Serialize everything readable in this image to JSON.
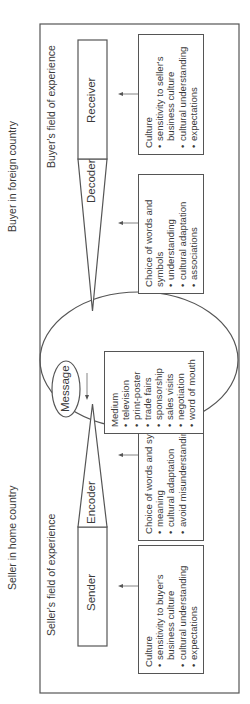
{
  "regions": {
    "seller_label": "Seller in home country",
    "buyer_label": "Buyer in foreign country"
  },
  "fields": {
    "seller": "Seller's field of experience",
    "buyer": "Buyer's field of experience"
  },
  "channel": {
    "sender": "Sender",
    "encoder": "Encoder",
    "decoder": "Decoder",
    "receiver": "Receiver",
    "message": "Message"
  },
  "boxes": {
    "seller_culture": {
      "title": "Culture",
      "items": [
        "sensitivity to buyer's business culture",
        "cultural understanding",
        "expectations"
      ]
    },
    "seller_words": {
      "title": "Choice of words and symbols",
      "items": [
        "meaning",
        "cultural adaptation",
        "avoid misunderstanding"
      ]
    },
    "medium": {
      "title": "Medium",
      "items": [
        "television",
        "print-poster",
        "trade fairs",
        "sponsorship",
        "sales visits",
        "negotiation",
        "word of mouth"
      ]
    },
    "buyer_words": {
      "title": "Choice of words and symbols",
      "items": [
        "understanding",
        "cultural adaptation",
        "associations"
      ]
    },
    "buyer_culture": {
      "title": "Culture",
      "items": [
        "sensitivity to seller's business culture",
        "cultural understanding",
        "expectations"
      ]
    }
  },
  "colors": {
    "line": "#555555",
    "text": "#333333",
    "background": "#ffffff"
  }
}
